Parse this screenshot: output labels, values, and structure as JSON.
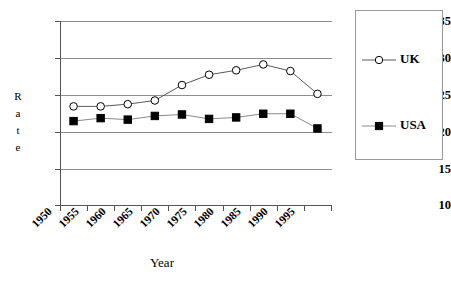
{
  "chart_data": {
    "type": "line",
    "title": "",
    "xlabel": "Year",
    "ylabel": "Rate",
    "ylabel_letters": [
      "R",
      "a",
      "t",
      "e"
    ],
    "categories": [
      "1950",
      "1955",
      "1960",
      "1965",
      "1970",
      "1975",
      "1980",
      "1985",
      "1990",
      "1995"
    ],
    "ylim": [
      10,
      35
    ],
    "ytick_values": [
      35,
      30,
      25,
      20,
      15,
      10
    ],
    "ytick_labels": [
      "35",
      "30",
      "25",
      "20",
      "15",
      "10"
    ],
    "grid": true,
    "grid_axis": "y",
    "legend_position": "right",
    "series": [
      {
        "name": "UK",
        "marker": "open-circle",
        "marker_fill": "#ffffff",
        "line_color": "#5a5a5a",
        "values": [
          23.4,
          23.4,
          23.7,
          24.2,
          26.3,
          27.7,
          28.3,
          29.1,
          28.2,
          25.1
        ]
      },
      {
        "name": "USA",
        "marker": "filled-square",
        "marker_fill": "#000000",
        "line_color": "#8a8a8a",
        "values": [
          21.4,
          21.8,
          21.6,
          22.1,
          22.3,
          21.7,
          21.9,
          22.4,
          22.4,
          20.4
        ]
      }
    ]
  },
  "legend": {
    "entries": [
      {
        "label": "UK",
        "marker": "open-circle"
      },
      {
        "label": "USA",
        "marker": "filled-square"
      }
    ]
  },
  "colors": {
    "axis": "#555555",
    "gridline": "#8d8d8d",
    "uk_line": "#5a5a5a",
    "usa_line": "#8a8a8a",
    "marker_outline": "#000000",
    "text": "#000000"
  }
}
